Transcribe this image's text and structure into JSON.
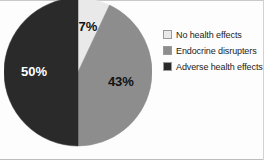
{
  "chart_data": {
    "type": "pie",
    "title": "",
    "subtitle": "",
    "xlabel": "",
    "ylabel": "",
    "legend_position": "right",
    "grid": false,
    "categories": [
      "No health effects",
      "Endocrine disrupters",
      "Adverse health effects"
    ],
    "values": [
      7,
      43,
      50
    ],
    "value_labels": [
      "7%",
      "43%",
      "50%"
    ],
    "colors": [
      "#e9e9e9",
      "#8d8d8d",
      "#2a2a2a"
    ],
    "label_text_colors": [
      "#111111",
      "#111111",
      "#ffffff"
    ],
    "start_angle_deg": 0,
    "direction": "clockwise",
    "slices": [
      {
        "name": "No health effects",
        "value": 7,
        "label": "7%",
        "color": "#e9e9e9",
        "label_color": "#111111"
      },
      {
        "name": "Endocrine disrupters",
        "value": 43,
        "label": "43%",
        "color": "#8d8d8d",
        "label_color": "#111111"
      },
      {
        "name": "Adverse health effects",
        "value": 50,
        "label": "50%",
        "color": "#2a2a2a",
        "label_color": "#ffffff"
      }
    ]
  },
  "legend": {
    "items": [
      {
        "label": "No health effects",
        "color": "#e9e9e9"
      },
      {
        "label": "Endocrine disrupters",
        "color": "#8d8d8d"
      },
      {
        "label": "Adverse health effects",
        "color": "#2a2a2a"
      }
    ]
  },
  "colors": {
    "background": "#fdfdfd",
    "slice_light": "#e9e9e9",
    "slice_medium": "#8d8d8d",
    "slice_dark": "#2a2a2a",
    "text": "#1c1c1c"
  }
}
